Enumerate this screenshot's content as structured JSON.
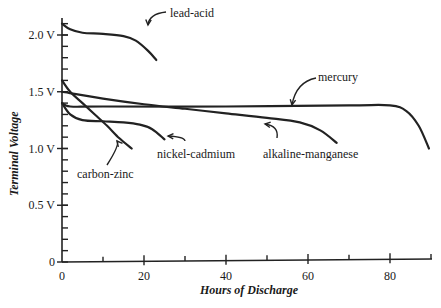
{
  "chart_data": {
    "type": "line",
    "title": "",
    "xlabel": "Hours of Discharge",
    "ylabel": "Terminal Voltage",
    "xlim": [
      0,
      90
    ],
    "ylim": [
      0,
      2.2
    ],
    "x_ticks": [
      {
        "value": 0,
        "label": "0"
      },
      {
        "value": 20,
        "label": "20"
      },
      {
        "value": 40,
        "label": "40"
      },
      {
        "value": 60,
        "label": "60"
      },
      {
        "value": 80,
        "label": "80"
      }
    ],
    "x_minor_ticks": [
      10,
      30,
      50,
      70,
      90
    ],
    "y_ticks": [
      {
        "value": 0,
        "label": "0"
      },
      {
        "value": 0.5,
        "label": "0.5 V"
      },
      {
        "value": 1.0,
        "label": "1.0 V"
      },
      {
        "value": 1.5,
        "label": "1.5 V"
      },
      {
        "value": 2.0,
        "label": "2.0 V"
      }
    ],
    "y_minor_step": 0.1,
    "grid": false,
    "legend": "inline annotations with arrows",
    "series": [
      {
        "name": "lead-acid",
        "x": [
          0,
          2,
          5,
          10,
          15,
          18,
          21,
          23
        ],
        "y": [
          2.1,
          2.05,
          2.02,
          2.01,
          1.99,
          1.95,
          1.86,
          1.78
        ],
        "label_pos": {
          "x": 170,
          "y": 17
        },
        "arrow": {
          "from": [
            166,
            12
          ],
          "to": [
            148,
            25
          ]
        }
      },
      {
        "name": "mercury",
        "x": [
          0,
          2,
          10,
          40,
          70,
          80,
          84,
          87,
          89.5
        ],
        "y": [
          1.4,
          1.37,
          1.37,
          1.37,
          1.38,
          1.38,
          1.33,
          1.2,
          1.0
        ],
        "label_pos": {
          "x": 318,
          "y": 81
        },
        "arrow": {
          "from": [
            316,
            78
          ],
          "to": [
            292,
            105
          ]
        }
      },
      {
        "name": "alkaline-manganese",
        "x": [
          0,
          10,
          20,
          30,
          40,
          50,
          58,
          63,
          67
        ],
        "y": [
          1.5,
          1.44,
          1.39,
          1.35,
          1.31,
          1.27,
          1.23,
          1.16,
          1.05
        ],
        "label_pos": {
          "x": 263,
          "y": 158
        },
        "arrow": {
          "from": [
            277,
            138
          ],
          "to": [
            265,
            124
          ]
        }
      },
      {
        "name": "nickel-cadmium",
        "x": [
          0,
          2,
          5,
          10,
          15,
          19,
          22,
          25
        ],
        "y": [
          1.4,
          1.3,
          1.25,
          1.24,
          1.23,
          1.21,
          1.17,
          1.08
        ],
        "label_pos": {
          "x": 157,
          "y": 158
        },
        "arrow": {
          "from": [
            185,
            141
          ],
          "to": [
            168,
            136
          ]
        }
      },
      {
        "name": "carbon-zinc",
        "x": [
          0,
          2,
          5,
          8,
          11,
          14,
          17
        ],
        "y": [
          1.6,
          1.5,
          1.4,
          1.3,
          1.2,
          1.09,
          1.0
        ],
        "label_pos": {
          "x": 77,
          "y": 178
        },
        "arrow": {
          "from": [
            107,
            165
          ],
          "to": [
            117,
            141
          ]
        }
      }
    ]
  }
}
